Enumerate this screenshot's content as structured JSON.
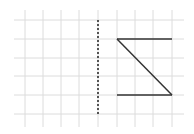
{
  "diagram": {
    "type": "grid-reflection",
    "grid": {
      "cols_x": [
        25,
        43,
        61,
        79,
        98,
        117,
        135,
        153,
        172
      ],
      "rows_y": [
        20,
        39,
        58,
        76,
        95,
        114
      ],
      "color": "#dcdcdc"
    },
    "mirror_line": {
      "x": 98,
      "y1": 20,
      "y2": 114,
      "style": "dotted",
      "color": "#222222"
    },
    "shape": {
      "segments": [
        {
          "x1": 117,
          "y1": 39,
          "x2": 172,
          "y2": 39
        },
        {
          "x1": 117,
          "y1": 39,
          "x2": 172,
          "y2": 95
        },
        {
          "x1": 117,
          "y1": 95,
          "x2": 172,
          "y2": 95
        }
      ],
      "color": "#333333"
    }
  }
}
